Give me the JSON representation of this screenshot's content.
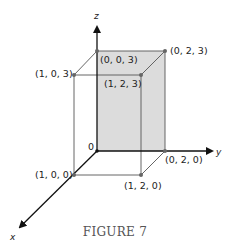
{
  "figure": {
    "caption": "FIGURE 7",
    "colors": {
      "face_fill": "#dcdcdc",
      "edge": "#555555",
      "axis": "#111111",
      "point": "#666666"
    },
    "axes": {
      "x_label": "x",
      "y_label": "y",
      "z_label": "z",
      "origin_label": "0"
    },
    "points": [
      {
        "label": "(0, 0, 3)",
        "coords": [
          0,
          0,
          3
        ]
      },
      {
        "label": "(0, 2, 3)",
        "coords": [
          0,
          2,
          3
        ]
      },
      {
        "label": "(1, 0, 3)",
        "coords": [
          1,
          0,
          3
        ]
      },
      {
        "label": "(1, 2, 3)",
        "coords": [
          1,
          2,
          3
        ]
      },
      {
        "label": "(0, 2, 0)",
        "coords": [
          0,
          2,
          0
        ]
      },
      {
        "label": "(1, 0, 0)",
        "coords": [
          1,
          0,
          0
        ]
      },
      {
        "label": "(1, 2, 0)",
        "coords": [
          1,
          2,
          0
        ]
      }
    ]
  }
}
